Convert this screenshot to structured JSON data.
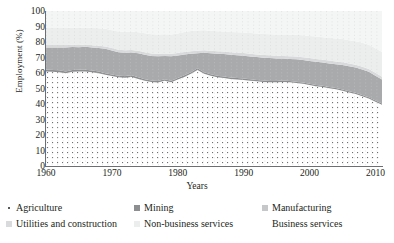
{
  "chart_data": {
    "type": "area",
    "title": "",
    "xlabel": "Years",
    "ylabel": "Employment (%)",
    "xlim": [
      1960,
      2011
    ],
    "ylim": [
      0,
      100
    ],
    "grid": "vertical-dotted",
    "stacked": true,
    "legend_position": "bottom",
    "y_ticks": [
      "100",
      "90",
      "80",
      "70",
      "60",
      "50",
      "40",
      "30",
      "20",
      "10",
      "0"
    ],
    "y_tick_values": [
      100,
      90,
      80,
      70,
      60,
      50,
      40,
      30,
      20,
      10,
      0
    ],
    "x_ticks": [
      "1960",
      "1970",
      "1980",
      "1990",
      "2000",
      "2010"
    ],
    "x_tick_values": [
      1960,
      1970,
      1980,
      1990,
      2000,
      2010
    ],
    "x": [
      1960,
      1961,
      1962,
      1963,
      1964,
      1965,
      1966,
      1967,
      1968,
      1969,
      1970,
      1971,
      1972,
      1973,
      1974,
      1975,
      1976,
      1977,
      1978,
      1979,
      1980,
      1981,
      1982,
      1983,
      1984,
      1985,
      1986,
      1987,
      1988,
      1989,
      1990,
      1991,
      1992,
      1993,
      1994,
      1995,
      1996,
      1997,
      1998,
      1999,
      2000,
      2001,
      2002,
      2003,
      2004,
      2005,
      2006,
      2007,
      2008,
      2009,
      2010,
      2011
    ],
    "series": [
      {
        "name": "Agriculture",
        "color": "#ffffff",
        "pattern": "dotted",
        "values": [
          61.0,
          60.8,
          60.5,
          59.8,
          60.8,
          61.0,
          61.0,
          60.5,
          59.8,
          58.8,
          58.0,
          57.2,
          57.0,
          57.5,
          56.2,
          55.0,
          54.2,
          53.8,
          55.0,
          54.0,
          55.8,
          57.5,
          59.5,
          62.0,
          59.5,
          58.2,
          57.2,
          56.8,
          56.2,
          55.8,
          55.5,
          55.0,
          54.6,
          54.2,
          54.0,
          54.0,
          54.2,
          54.0,
          53.5,
          53.0,
          52.2,
          51.5,
          51.0,
          50.2,
          49.5,
          48.5,
          47.5,
          46.5,
          45.0,
          43.5,
          41.5,
          39.5
        ]
      },
      {
        "name": "Mining",
        "color": "#8d8e90",
        "values": [
          1.2,
          1.2,
          1.2,
          1.2,
          1.2,
          1.1,
          1.1,
          1.1,
          1.1,
          1.0,
          1.0,
          1.0,
          1.0,
          1.0,
          1.0,
          1.0,
          1.0,
          1.0,
          1.0,
          1.0,
          1.0,
          1.0,
          1.0,
          1.0,
          1.0,
          1.0,
          1.0,
          1.0,
          0.9,
          0.9,
          0.9,
          0.9,
          0.9,
          0.9,
          0.9,
          0.9,
          0.9,
          0.9,
          0.9,
          0.9,
          0.8,
          0.8,
          0.8,
          0.8,
          0.8,
          0.8,
          0.8,
          0.8,
          0.8,
          0.8,
          0.8,
          0.8
        ]
      },
      {
        "name": "Manufacturing",
        "color": "#a9aaac",
        "values": [
          14.3,
          14.5,
          14.8,
          15.5,
          14.8,
          14.5,
          14.8,
          14.8,
          15.2,
          15.8,
          15.5,
          15.2,
          15.0,
          14.8,
          15.5,
          15.8,
          15.8,
          16.0,
          15.0,
          15.8,
          14.5,
          13.5,
          12.0,
          9.8,
          12.5,
          13.5,
          14.2,
          14.4,
          14.7,
          14.8,
          14.8,
          14.8,
          14.8,
          14.8,
          14.8,
          14.5,
          14.2,
          14.2,
          14.5,
          14.5,
          14.8,
          15.0,
          15.0,
          15.2,
          15.4,
          15.8,
          16.0,
          16.2,
          16.5,
          16.5,
          16.0,
          15.5
        ]
      },
      {
        "name": "Utilities and construction",
        "color": "#d9dadb",
        "values": [
          1.5,
          1.5,
          1.5,
          1.5,
          1.5,
          1.5,
          1.5,
          1.5,
          1.5,
          1.5,
          1.6,
          1.6,
          1.6,
          1.6,
          1.6,
          1.6,
          1.6,
          1.6,
          1.6,
          1.6,
          1.6,
          1.6,
          1.6,
          1.6,
          1.6,
          1.6,
          1.6,
          1.6,
          1.6,
          1.6,
          1.7,
          1.7,
          1.7,
          1.7,
          1.7,
          1.7,
          1.7,
          1.7,
          1.7,
          1.7,
          1.8,
          1.8,
          1.8,
          1.8,
          1.8,
          1.8,
          1.8,
          1.8,
          1.8,
          1.8,
          1.8,
          1.8
        ]
      },
      {
        "name": "Non-business services",
        "color": "#eceded",
        "values": [
          11.0,
          11.0,
          11.0,
          11.0,
          11.0,
          11.0,
          11.0,
          11.2,
          11.2,
          11.4,
          11.5,
          11.7,
          11.8,
          11.8,
          12.0,
          12.2,
          12.4,
          12.4,
          12.4,
          12.4,
          12.6,
          12.8,
          13.0,
          13.0,
          13.0,
          13.0,
          13.0,
          13.0,
          13.0,
          13.2,
          13.2,
          13.4,
          13.5,
          13.6,
          13.6,
          13.8,
          13.8,
          14.0,
          14.0,
          14.2,
          14.2,
          14.4,
          14.5,
          14.6,
          14.8,
          15.0,
          15.1,
          15.2,
          15.4,
          15.6,
          15.8,
          16.0
        ]
      },
      {
        "name": "Business services",
        "color": "#f4f5f5",
        "values": [
          11.0,
          11.0,
          11.0,
          11.0,
          10.7,
          10.9,
          10.6,
          11.0,
          11.2,
          11.5,
          12.4,
          13.3,
          13.6,
          13.3,
          13.7,
          14.4,
          15.0,
          15.2,
          15.0,
          15.2,
          14.5,
          13.6,
          12.9,
          12.6,
          12.4,
          12.7,
          13.0,
          13.2,
          13.6,
          13.7,
          13.9,
          14.2,
          14.5,
          14.8,
          15.0,
          15.1,
          15.2,
          15.2,
          15.4,
          15.7,
          16.2,
          16.5,
          16.9,
          17.4,
          17.7,
          18.1,
          18.8,
          19.5,
          20.5,
          21.8,
          24.1,
          26.4
        ]
      }
    ]
  },
  "axes": {
    "y_title": "Employment (%)",
    "x_title": "Years"
  },
  "legend": {
    "rows": [
      [
        {
          "label": "Agriculture",
          "marker": "agriculture-swatch",
          "color": "#ffffff"
        },
        {
          "label": "Mining",
          "marker": "mining-swatch",
          "color": "#8d8e90"
        },
        {
          "label": "Manufacturing",
          "marker": "manufacturing-swatch",
          "color": "#c6c7c9"
        }
      ],
      [
        {
          "label": "Utilities and construction",
          "marker": "utilities-swatch",
          "color": "#d9dadb"
        },
        {
          "label": "Non-business services",
          "marker": "nonbusiness-swatch",
          "color": "#eceded"
        },
        {
          "label": "Business services",
          "marker": "business-swatch",
          "color": "#ffffff"
        }
      ]
    ]
  }
}
